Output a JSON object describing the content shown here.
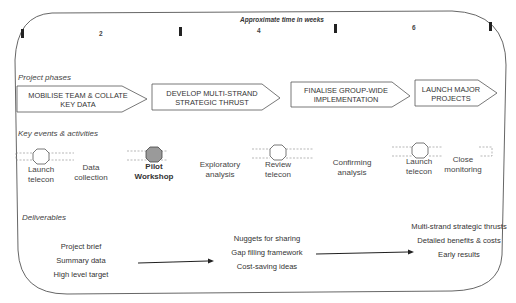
{
  "timeline": {
    "title": "Approximate time in weeks",
    "ticks": [
      "2",
      "4",
      "6"
    ]
  },
  "sections": {
    "phases": "Project phases",
    "events": "Key events & activities",
    "deliverables": "Deliverables"
  },
  "phases": [
    {
      "label_line1": "MOBILISE TEAM & COLLATE",
      "label_line2": "KEY DATA"
    },
    {
      "label_line1": "DEVELOP MULTI-STRAND",
      "label_line2": "STRATEGIC THRUST"
    },
    {
      "label_line1": "FINALISE GROUP-WIDE",
      "label_line2": "IMPLEMENTATION"
    },
    {
      "label_line1": "LAUNCH MAJOR",
      "label_line2": "PROJECTS"
    }
  ],
  "events": [
    {
      "line1": "Launch",
      "line2": "telecon",
      "milestone": true,
      "highlight": false
    },
    {
      "line1": "Data",
      "line2": "collection",
      "milestone": false,
      "highlight": false
    },
    {
      "line1": "Pilot",
      "line2": "Workshop",
      "milestone": true,
      "highlight": true
    },
    {
      "line1": "Exploratory",
      "line2": "analysis",
      "milestone": false,
      "highlight": false
    },
    {
      "line1": "Review",
      "line2": "telecon",
      "milestone": true,
      "highlight": false
    },
    {
      "line1": "Confirming",
      "line2": "analysis",
      "milestone": false,
      "highlight": false
    },
    {
      "line1": "Launch",
      "line2": "telecon",
      "milestone": true,
      "highlight": false
    },
    {
      "line1": "Close",
      "line2": "monitoring",
      "milestone": false,
      "highlight": false
    }
  ],
  "deliverables": [
    {
      "items": [
        "Project brief",
        "Summary data",
        "High level target"
      ]
    },
    {
      "items": [
        "Nuggets for sharing",
        "Gap filling framework",
        "Cost-saving ideas"
      ]
    },
    {
      "items": [
        "Multi-strand strategic thrusts",
        "Detailed benefits & costs",
        "Early results"
      ]
    }
  ],
  "colors": {
    "line": "#555555",
    "milestone_fill": "#ffffff",
    "milestone_highlight": "#9a9a9a",
    "dashed": "#888888"
  }
}
